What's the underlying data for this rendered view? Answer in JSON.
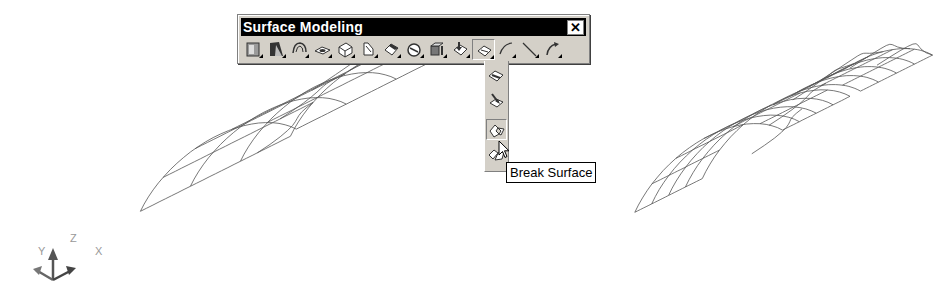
{
  "toolbar": {
    "title": "Surface Modeling",
    "close_label": "✕",
    "buttons": [
      {
        "name": "layout-surface-tool",
        "icon": "surface-layout-icon"
      },
      {
        "name": "primitive-surface-tool",
        "icon": "primitive-surface-icon"
      },
      {
        "name": "revolve-surface-tool",
        "icon": "revolve-surface-icon"
      },
      {
        "name": "planar-surface-tool",
        "icon": "planar-surface-icon"
      },
      {
        "name": "offset-surface-tool",
        "icon": "offset-surface-icon"
      },
      {
        "name": "sweep-surface-tool",
        "icon": "sweep-surface-icon"
      },
      {
        "name": "blend-surface-tool",
        "icon": "blend-surface-icon"
      },
      {
        "name": "rotate-surface-tool",
        "icon": "rotate-surface-icon"
      },
      {
        "name": "extrude-surface-tool",
        "icon": "extrude-surface-icon"
      },
      {
        "name": "edit-surface-tool",
        "icon": "edit-surface-icon"
      },
      {
        "name": "trim-surface-tool",
        "icon": "trim-surface-icon",
        "pressed": true
      },
      {
        "name": "curve-tool",
        "icon": "curve-icon"
      },
      {
        "name": "line-tool",
        "icon": "line-icon"
      },
      {
        "name": "fillet-tool",
        "icon": "fillet-icon"
      }
    ]
  },
  "flyout": {
    "items": [
      {
        "name": "trim-surface",
        "icon": "trim-surface-icon"
      },
      {
        "name": "untrim-surface",
        "icon": "untrim-surface-icon"
      },
      {
        "name": "break-surface",
        "icon": "break-surface-icon",
        "pressed": true
      },
      {
        "name": "join-surface",
        "icon": "join-surface-icon"
      }
    ]
  },
  "tooltip": {
    "text": "Break Surface"
  },
  "ucs": {
    "x_label": "X",
    "y_label": "Y",
    "z_label": "Z"
  },
  "scene": {
    "surfaces": [
      {
        "name": "original-surface",
        "state": "unbroken",
        "u_divisions": 6,
        "v_divisions": 5
      },
      {
        "name": "broken-surface",
        "state": "broken into two pieces",
        "u_divisions": 6,
        "v_divisions": 8
      }
    ],
    "line_color": "#555555"
  }
}
